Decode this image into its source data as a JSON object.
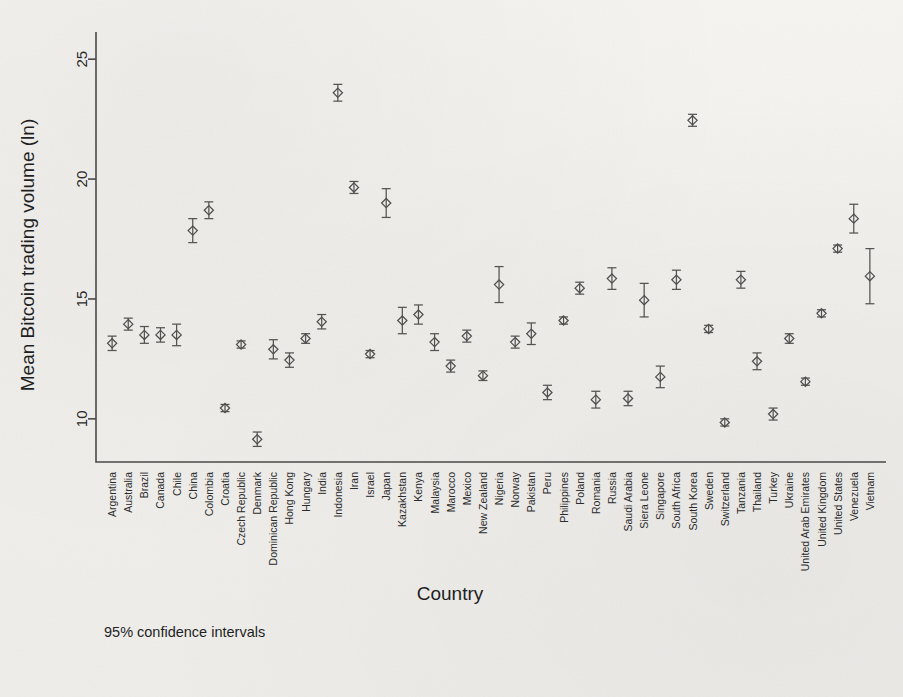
{
  "chart_data": {
    "type": "scatter",
    "title": "",
    "xlabel": "Country",
    "ylabel": "Mean Bitcoin trading volume (ln)",
    "note": "95% confidence intervals",
    "ylim": [
      8.2,
      25.8
    ],
    "yticks": [
      10,
      15,
      20,
      25
    ],
    "grid": false,
    "legend": "none",
    "error_bars": "95% CI",
    "categories": [
      "Argentina",
      "Australia",
      "Brazil",
      "Canada",
      "Chile",
      "China",
      "Colombia",
      "Croatia",
      "Czech Republic",
      "Denmark",
      "Dominican Republic",
      "Hong Kong",
      "Hungary",
      "India",
      "Indonesia",
      "Iran",
      "Israel",
      "Japan",
      "Kazakhstan",
      "Kenya",
      "Malaysia",
      "Marocco",
      "Mexico",
      "New Zealand",
      "Nigeria",
      "Norway",
      "Pakistan",
      "Peru",
      "Philippines",
      "Poland",
      "Romania",
      "Russia",
      "Saudi Arabia",
      "Siera Leone",
      "Singapore",
      "South Africa",
      "South Korea",
      "Sweden",
      "Switzerland",
      "Tanzania",
      "Thailand",
      "Turkey",
      "Ukraine",
      "United Arab Emirates",
      "United Kingdom",
      "United States",
      "Venezuela",
      "Vietnam"
    ],
    "values": [
      13.15,
      13.95,
      13.5,
      13.5,
      13.5,
      17.85,
      18.7,
      10.45,
      13.1,
      9.15,
      12.9,
      12.45,
      13.35,
      14.05,
      23.6,
      19.65,
      12.7,
      19.0,
      14.1,
      14.35,
      13.2,
      12.2,
      13.45,
      11.8,
      15.6,
      13.2,
      13.55,
      11.1,
      14.1,
      15.45,
      10.8,
      15.85,
      10.85,
      14.95,
      11.75,
      15.8,
      22.45,
      13.75,
      9.85,
      15.8,
      12.4,
      10.2,
      13.35,
      11.55,
      14.4,
      17.1,
      18.35,
      15.95
    ],
    "ci_low": [
      12.85,
      13.7,
      13.15,
      13.2,
      13.05,
      17.35,
      18.35,
      10.3,
      12.95,
      8.85,
      12.5,
      12.15,
      13.15,
      13.75,
      23.25,
      19.4,
      12.55,
      18.4,
      13.55,
      13.95,
      12.85,
      11.95,
      13.2,
      11.6,
      14.85,
      12.95,
      13.1,
      10.8,
      13.95,
      15.2,
      10.45,
      15.4,
      10.55,
      14.25,
      11.3,
      15.4,
      22.2,
      13.6,
      9.7,
      15.45,
      12.05,
      9.95,
      13.15,
      11.4,
      14.25,
      16.95,
      17.75,
      14.8
    ],
    "ci_high": [
      13.45,
      14.2,
      13.85,
      13.8,
      13.95,
      18.35,
      19.05,
      10.6,
      13.25,
      9.45,
      13.3,
      12.75,
      13.55,
      14.35,
      23.95,
      19.9,
      12.85,
      19.6,
      14.65,
      14.75,
      13.55,
      12.45,
      13.7,
      12.0,
      16.35,
      13.45,
      14.0,
      11.4,
      14.25,
      15.7,
      11.15,
      16.3,
      11.15,
      15.65,
      12.2,
      16.2,
      22.7,
      13.9,
      10.0,
      16.15,
      12.75,
      10.45,
      13.55,
      11.7,
      14.55,
      17.25,
      18.95,
      17.1
    ],
    "marker_shape": "diamond-circle",
    "marker_color": "#4f4f4f",
    "frame_color": "#4a4a4a"
  }
}
